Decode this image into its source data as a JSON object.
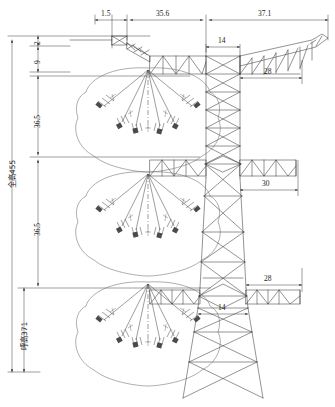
{
  "drawing": {
    "type": "transmission-tower-elevation",
    "units": "decimetre-scale CAD units",
    "line_color": "#3a3a3a",
    "envelope_color": "#6e6e6e",
    "background": "#ffffff"
  },
  "dimensions": {
    "top_row": [
      {
        "name": "peak-offset",
        "value": "1.5"
      },
      {
        "name": "upper-arm-left",
        "value": "35.6"
      },
      {
        "name": "upper-arm-right",
        "value": "37.1"
      }
    ],
    "vertical_left": [
      {
        "name": "peak-cap",
        "value": "2"
      },
      {
        "name": "peak-to-upper-arm",
        "value": "9"
      },
      {
        "name": "upper-to-middle-arm",
        "value": "36.5"
      },
      {
        "name": "middle-to-lower-arm",
        "value": "36.5"
      }
    ],
    "overall_height_label": "全高455",
    "ground_clearance_label": "呼高371",
    "body_widths": [
      {
        "name": "upper-body-width",
        "value": "14"
      },
      {
        "name": "upper-arm-reach",
        "value": "28"
      },
      {
        "name": "middle-arm-reach",
        "value": "30"
      },
      {
        "name": "lower-arm-reach",
        "value": "28"
      },
      {
        "name": "lower-body-width",
        "value": "14"
      }
    ]
  },
  "components": {
    "earthwire_peaks": 2,
    "crossarms": 3,
    "insulator_strings_per_arm": 6,
    "swing_envelopes": 3,
    "body_panels": "x-braced lattice"
  }
}
